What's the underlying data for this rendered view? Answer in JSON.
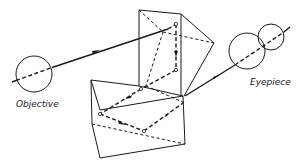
{
  "figure": {
    "labels": {
      "objective": "Objective",
      "eyepiece": "Eyepiece"
    },
    "components": [
      {
        "name": "objective-lens",
        "shape": "circle"
      },
      {
        "name": "upper-prism",
        "shape": "right-angle-prism"
      },
      {
        "name": "lower-prism",
        "shape": "right-angle-prism"
      },
      {
        "name": "eyepiece-lens-1",
        "shape": "circle"
      },
      {
        "name": "eyepiece-lens-2",
        "shape": "circle"
      }
    ],
    "colors": {
      "ink": "#1a1a1a",
      "background": "#ffffff"
    }
  }
}
